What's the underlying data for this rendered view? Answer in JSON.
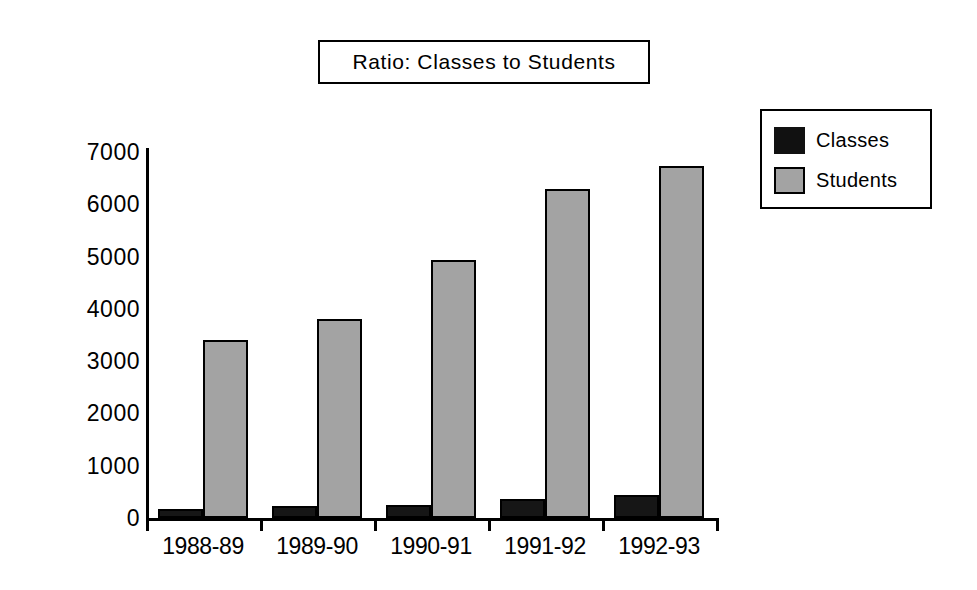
{
  "chart_data": {
    "type": "bar",
    "title": "Ratio: Classes to Students",
    "xlabel": "",
    "ylabel": "",
    "categories": [
      "1988-89",
      "1989-90",
      "1990-91",
      "1991-92",
      "1992-93"
    ],
    "series": [
      {
        "name": "Classes",
        "color": "#161616",
        "values": [
          170,
          230,
          250,
          370,
          440
        ]
      },
      {
        "name": "Students",
        "color": "#a3a3a3",
        "values": [
          3400,
          3800,
          4930,
          6300,
          6730
        ]
      }
    ],
    "ylim": [
      0,
      7000
    ],
    "y_ticks": [
      "0",
      "1000",
      "2000",
      "3000",
      "4000",
      "5000",
      "6000",
      "7000"
    ],
    "grid": false,
    "legend_position": "top-right",
    "legend_entries": [
      "Classes",
      "Students"
    ]
  },
  "legend": {
    "items": [
      {
        "label": "Classes"
      },
      {
        "label": "Students"
      }
    ]
  }
}
